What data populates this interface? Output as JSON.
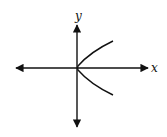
{
  "diagram": {
    "type": "graph-sketch",
    "axes": {
      "x_label": "x",
      "y_label": "y",
      "origin_px": [
        77,
        68
      ]
    },
    "curve": {
      "shape": "parabola opening right",
      "vertex": [
        0,
        0
      ],
      "upper_branch_end_px": [
        113,
        41
      ],
      "lower_branch_end_px": [
        113,
        95
      ]
    },
    "colors": {
      "stroke": "#111111",
      "background": "#ffffff"
    }
  }
}
